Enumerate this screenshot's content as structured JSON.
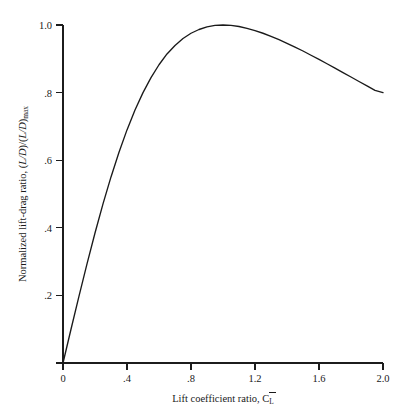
{
  "figure": {
    "background_color": "#ffffff",
    "line_color": "#1a1a1a",
    "axis_color": "#1c1c1c"
  },
  "chart_data": {
    "type": "line",
    "title": "",
    "xlabel_parts": {
      "text": "Lift coefficient ratio, ",
      "symbol": "C",
      "overbar": true,
      "subscript": "L"
    },
    "xlabel": "Lift coefficient ratio, C̄L",
    "ylabel_parts": {
      "text": "Normalized lift-drag ratio, ",
      "expr_open": "(",
      "expr_ld1": "L/D",
      "expr_mid": ")/(",
      "expr_ld2": "L/D",
      "expr_close": ")",
      "subscript": "max"
    },
    "ylabel": "Normalized lift-drag ratio, (L/D)/(L/D)max",
    "xlim": [
      0,
      2.0
    ],
    "ylim": [
      0,
      1.0
    ],
    "xticks": [
      0,
      0.4,
      0.8,
      1.2,
      1.6,
      2.0
    ],
    "xtick_labels": [
      "0",
      ".4",
      ".8",
      "1.2",
      "1.6",
      "2.0"
    ],
    "yticks": [
      0,
      0.2,
      0.4,
      0.6,
      0.8,
      1.0
    ],
    "ytick_labels": [
      "0",
      ".2",
      ".4",
      ".6",
      ".8",
      "1.0"
    ],
    "grid": false,
    "legend": false,
    "legend_position": "none",
    "equation": "y = 2x / (1 + x^2)",
    "x": [
      0,
      0.05,
      0.1,
      0.15,
      0.2,
      0.25,
      0.3,
      0.35,
      0.4,
      0.45,
      0.5,
      0.55,
      0.6,
      0.65,
      0.7,
      0.75,
      0.8,
      0.85,
      0.9,
      0.95,
      1.0,
      1.05,
      1.1,
      1.15,
      1.2,
      1.25,
      1.3,
      1.35,
      1.4,
      1.45,
      1.5,
      1.55,
      1.6,
      1.65,
      1.7,
      1.75,
      1.8,
      1.85,
      1.9,
      1.95,
      2.0
    ],
    "values": [
      0.0,
      0.0998,
      0.198,
      0.2933,
      0.3846,
      0.4706,
      0.5505,
      0.6236,
      0.6897,
      0.7485,
      0.8,
      0.8444,
      0.8824,
      0.9143,
      0.9396,
      0.96,
      0.9756,
      0.9867,
      0.9945,
      0.9987,
      1.0,
      0.9988,
      0.9955,
      0.99,
      0.9836,
      0.9756,
      0.9666,
      0.9565,
      0.9459,
      0.9344,
      0.9231,
      0.9105,
      0.8982,
      0.8853,
      0.8724,
      0.8593,
      0.8462,
      0.8329,
      0.8198,
      0.8065,
      0.8
    ],
    "annotations": []
  }
}
